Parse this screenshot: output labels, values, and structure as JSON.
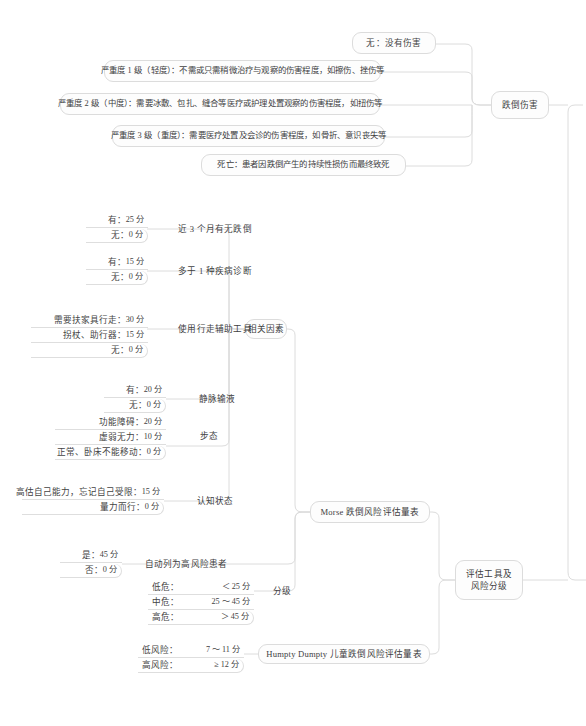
{
  "doc": {
    "title": "跌倒伤害与评估工具及风险分级 思维导图",
    "type": "mindmap",
    "background": "#ffffff",
    "node_fill": "#fdfdfd",
    "node_border": "#dcdcdc",
    "text_color": "#40403f",
    "line_color": "#dcdcdc"
  },
  "branches": {
    "fall_injury": {
      "label": "跌倒伤害",
      "items": [
        {
          "label": "无：没有伤害"
        },
        {
          "label": "严重度 1 级（轻度）：不需或只需稍微治疗与观察的伤害程度，如擦伤、挫伤等"
        },
        {
          "label": "严重度 2 级（中度）：需要冰敷、包扎、缝合等医疗或护理处置观察的伤害程度，如扭伤等"
        },
        {
          "label": "严重度 3 级（重度）：需要医疗处置及会诊的伤害程度，如骨折、意识丧失等"
        },
        {
          "label": "死亡：患者因跌倒产生的持续性损伤而最终致死"
        }
      ]
    },
    "tools_and_grading": {
      "label": "评估工具及\n风险分级",
      "label_line1": "评估工具及",
      "label_line2": "风险分级",
      "scales": [
        {
          "name": "Morse 跌倒风险评估量表",
          "factors_label": "相关因素",
          "factors": [
            {
              "name": "近 3 个月有无跌倒",
              "options": [
                {
                  "key": "有：",
                  "value": "25 分"
                },
                {
                  "key": "无：",
                  "value": "0 分"
                }
              ]
            },
            {
              "name": "多于 1 种疾病诊断",
              "options": [
                {
                  "key": "有：",
                  "value": "15 分"
                },
                {
                  "key": "无：",
                  "value": "0 分"
                }
              ]
            },
            {
              "name": "使用行走辅助工具",
              "options": [
                {
                  "key": "需要扶家具行走：",
                  "value": "30 分"
                },
                {
                  "key": "拐杖、助行器：",
                  "value": "15 分"
                },
                {
                  "key": "无：",
                  "value": "0 分"
                }
              ]
            },
            {
              "name": "静脉输液",
              "options": [
                {
                  "key": "有：",
                  "value": "20 分"
                },
                {
                  "key": "无：",
                  "value": "0 分"
                }
              ]
            },
            {
              "name": "步态",
              "options": [
                {
                  "key": "功能障碍：",
                  "value": "20 分"
                },
                {
                  "key": "虚弱无力：",
                  "value": "10 分"
                },
                {
                  "key": "正常、卧床不能移动：",
                  "value": "0 分"
                }
              ]
            },
            {
              "name": "认知状态",
              "options": [
                {
                  "key": "高估自己能力，忘记自己受限：",
                  "value": "15 分"
                },
                {
                  "key": "量力而行：",
                  "value": "0 分"
                }
              ]
            }
          ],
          "auto_high_risk": {
            "name": "自动列为高风险患者",
            "options": [
              {
                "key": "是：",
                "value": "45 分"
              },
              {
                "key": "否：",
                "value": "0 分"
              }
            ]
          },
          "grading": {
            "name": "分级",
            "options": [
              {
                "key": "低危：",
                "value": "＜ 25 分"
              },
              {
                "key": "中危：",
                "value": "25 ～ 45 分"
              },
              {
                "key": "高危：",
                "value": "＞ 45 分"
              }
            ]
          }
        },
        {
          "name": "Humpty Dumpty 儿童跌倒风险评估量表",
          "options": [
            {
              "key": "低风险：",
              "value": "7 ～ 11 分"
            },
            {
              "key": "高风险：",
              "value": "≥ 12 分"
            }
          ]
        }
      ]
    }
  }
}
